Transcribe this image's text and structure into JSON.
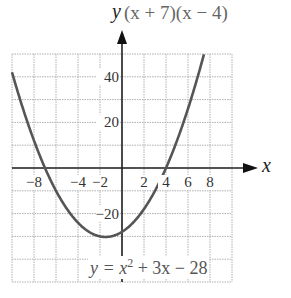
{
  "chart_data": {
    "type": "line",
    "title": "(x + 7)(x − 4)",
    "xlabel": "x",
    "ylabel": "y",
    "equation": "y = x^2 + 3x − 28",
    "xlim": [
      -10,
      10
    ],
    "ylim": [
      -50,
      50
    ],
    "grid": true,
    "x_ticks": [
      -8,
      -4,
      -2,
      2,
      4,
      6,
      8
    ],
    "y_ticks": [
      40,
      20,
      -20
    ],
    "series": [
      {
        "name": "y = x^2 + 3x − 28",
        "function": "x^2 + 3x - 28",
        "x": [
          -10,
          -9,
          -8,
          -7,
          -6,
          -5,
          -4,
          -3,
          -2,
          -1.5,
          -1,
          0,
          1,
          2,
          3,
          4,
          5,
          6
        ],
        "y": [
          42,
          26,
          12,
          0,
          -10,
          -18,
          -24,
          -28,
          -30,
          -30.25,
          -30,
          -28,
          -24,
          -18,
          -10,
          0,
          12,
          26
        ]
      }
    ],
    "roots": [
      -7,
      4
    ],
    "vertex": [
      -1.5,
      -30.25
    ]
  },
  "labels": {
    "title": "(x + 7)(x − 4)",
    "y_axis": "y",
    "x_axis": "x",
    "eq_prefix": "y = x",
    "eq_exp": "2",
    "eq_suffix": " + 3x − 28",
    "xtick_labels": [
      "−8",
      "−4",
      "−2",
      "2",
      "4",
      "6",
      "8"
    ],
    "ytick_labels": [
      "40",
      "20",
      "−20"
    ]
  },
  "colors": {
    "grid": "#b0b0b0",
    "curve": "#555555",
    "axis": "#222222"
  }
}
